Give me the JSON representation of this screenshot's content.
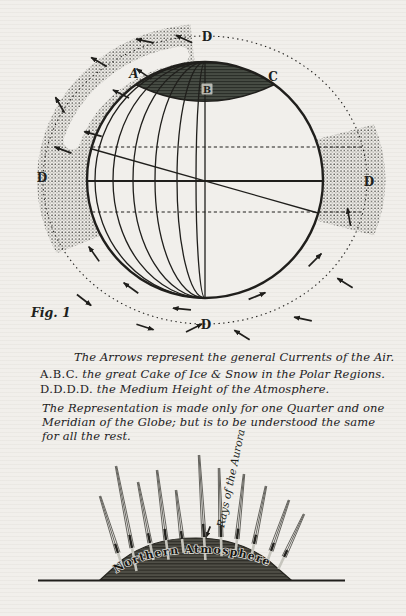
{
  "colors": {
    "paper": "#f1efeb",
    "ink": "#201f1c",
    "ice_cap_fill": "#474c44",
    "dome_fill": "#4f4e46",
    "stipple_dot": "#4c4c47",
    "hatch_dark": "#2b2f29",
    "ray_line": "#55544e",
    "ray_light": "#c6c5bd"
  },
  "figure": {
    "fig_label": "Fig. 1",
    "labels": {
      "d_top": "D",
      "d_left": "D",
      "d_right": "D",
      "d_bottom": "D",
      "a": "A",
      "b": "B",
      "c": "C"
    },
    "arrows": [
      {
        "x": 145,
        "y": 41,
        "a": 192
      },
      {
        "x": 184,
        "y": 39,
        "a": 205
      },
      {
        "x": 99,
        "y": 62,
        "a": 210
      },
      {
        "x": 60,
        "y": 105,
        "a": 240
      },
      {
        "x": 63,
        "y": 150,
        "a": 200
      },
      {
        "x": 144,
        "y": 74,
        "a": 215
      },
      {
        "x": 121,
        "y": 94,
        "a": 207
      },
      {
        "x": 93,
        "y": 134,
        "a": 195
      },
      {
        "x": 94,
        "y": 254,
        "a": 235
      },
      {
        "x": 131,
        "y": 288,
        "a": 216
      },
      {
        "x": 182,
        "y": 309,
        "a": 185
      },
      {
        "x": 84,
        "y": 300,
        "a": 38
      },
      {
        "x": 145,
        "y": 327,
        "a": 18
      },
      {
        "x": 194,
        "y": 328,
        "a": 333
      },
      {
        "x": 257,
        "y": 296,
        "a": 338
      },
      {
        "x": 315,
        "y": 260,
        "a": 315
      },
      {
        "x": 345,
        "y": 283,
        "a": 212
      },
      {
        "x": 303,
        "y": 319,
        "a": 192
      },
      {
        "x": 242,
        "y": 335,
        "a": 212
      },
      {
        "x": 349,
        "y": 217,
        "a": 260
      },
      {
        "x": 208,
        "y": 532,
        "a": 112,
        "l": 6
      }
    ]
  },
  "caption": {
    "lines": [
      {
        "prefix": "",
        "text": "The Arrows represent the general Currents of the Air."
      },
      {
        "prefix": "A.B.C.",
        "text": " the great Cake of Ice & Snow in the Polar Regions."
      },
      {
        "prefix": "D.D.D.D.",
        "text": " the Medium Height of the Atmosphere."
      },
      {
        "prefix": "",
        "text": "The Representation is made only for one Quarter and one"
      },
      {
        "prefix": "",
        "text": "Meridian of the Globe; but is to be understood the same"
      },
      {
        "prefix": "",
        "text": "for all the rest."
      }
    ]
  },
  "aurora": {
    "rays_label": "Rays of the Aurora",
    "dome_label": "Northern Atmosphere",
    "rays": [
      [
        118,
        553,
        100,
        496
      ],
      [
        132,
        548,
        116,
        466
      ],
      [
        150,
        543,
        138,
        482
      ],
      [
        166,
        540,
        157,
        470
      ],
      [
        182,
        539,
        176,
        490
      ],
      [
        204,
        537,
        199,
        455
      ],
      [
        221,
        537,
        219,
        468
      ],
      [
        237,
        539,
        244,
        474
      ],
      [
        254,
        544,
        266,
        486
      ],
      [
        271,
        551,
        289,
        500
      ],
      [
        284,
        557,
        304,
        514
      ]
    ]
  }
}
